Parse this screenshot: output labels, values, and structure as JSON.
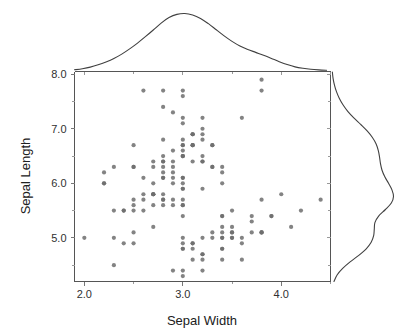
{
  "chart_data": {
    "type": "scatter",
    "title": "",
    "subtitle": "",
    "xlabel": "Sepal Width",
    "ylabel": "Sepal Length",
    "xlim": [
      1.9,
      4.5
    ],
    "ylim": [
      4.2,
      8.05
    ],
    "xticks": [
      2.0,
      3.0,
      4.0
    ],
    "xtick_labels": [
      "2.0",
      "3.0",
      "4.0"
    ],
    "yticks": [
      5.0,
      6.0,
      7.0,
      8.0
    ],
    "ytick_labels": [
      "5.0",
      "6.0",
      "7.0",
      "8.0"
    ],
    "x_minor_ticks": [
      2.5,
      3.5,
      4.5
    ],
    "y_minor_ticks": [
      4.5,
      5.5,
      6.5,
      7.5
    ],
    "grid": false,
    "legend": null,
    "marker_color": "#6d6d6d",
    "curve_color": "#404040",
    "axis_color": "#555555",
    "marginal": {
      "top": {
        "variable": "Sepal Width",
        "type": "kde",
        "peak_x": 3.02,
        "kde_x": [
          1.9,
          1.98,
          2.06,
          2.14,
          2.22,
          2.3,
          2.38,
          2.46,
          2.54,
          2.62,
          2.7,
          2.78,
          2.86,
          2.94,
          3.02,
          3.1,
          3.18,
          3.26,
          3.34,
          3.42,
          3.5,
          3.58,
          3.66,
          3.74,
          3.82,
          3.9,
          3.98,
          4.06,
          4.14,
          4.22,
          4.3,
          4.38,
          4.46
        ],
        "kde_y": [
          0.03,
          0.048,
          0.075,
          0.115,
          0.165,
          0.225,
          0.3,
          0.39,
          0.49,
          0.6,
          0.715,
          0.835,
          0.93,
          0.985,
          1.0,
          0.975,
          0.915,
          0.825,
          0.72,
          0.615,
          0.52,
          0.44,
          0.38,
          0.33,
          0.28,
          0.225,
          0.17,
          0.12,
          0.08,
          0.055,
          0.038,
          0.028,
          0.022
        ]
      },
      "right": {
        "variable": "Sepal Length",
        "type": "kde",
        "peak_y": 5.75,
        "kde_x": [
          4.2,
          4.32,
          4.44,
          4.56,
          4.68,
          4.8,
          4.92,
          5.04,
          5.16,
          5.28,
          5.4,
          5.52,
          5.64,
          5.76,
          5.88,
          6.0,
          6.12,
          6.24,
          6.36,
          6.48,
          6.6,
          6.72,
          6.84,
          6.96,
          7.08,
          7.2,
          7.32,
          7.44,
          7.56,
          7.68,
          7.8,
          7.92,
          8.04
        ],
        "kde_y": [
          0.04,
          0.09,
          0.18,
          0.3,
          0.44,
          0.56,
          0.64,
          0.68,
          0.69,
          0.7,
          0.76,
          0.87,
          0.965,
          1.0,
          0.975,
          0.92,
          0.86,
          0.815,
          0.79,
          0.775,
          0.755,
          0.72,
          0.66,
          0.575,
          0.47,
          0.36,
          0.262,
          0.185,
          0.125,
          0.08,
          0.048,
          0.026,
          0.014
        ]
      }
    },
    "points": [
      [
        3.5,
        5.1
      ],
      [
        3.0,
        4.9
      ],
      [
        3.2,
        4.7
      ],
      [
        3.1,
        4.6
      ],
      [
        3.6,
        5.0
      ],
      [
        3.9,
        5.4
      ],
      [
        3.4,
        4.6
      ],
      [
        3.4,
        5.0
      ],
      [
        2.9,
        4.4
      ],
      [
        3.1,
        4.9
      ],
      [
        3.7,
        5.4
      ],
      [
        3.4,
        4.8
      ],
      [
        3.0,
        4.8
      ],
      [
        3.0,
        4.3
      ],
      [
        4.0,
        5.8
      ],
      [
        4.4,
        5.7
      ],
      [
        3.9,
        5.4
      ],
      [
        3.5,
        5.1
      ],
      [
        3.8,
        5.7
      ],
      [
        3.8,
        5.1
      ],
      [
        3.4,
        5.4
      ],
      [
        3.7,
        5.1
      ],
      [
        3.6,
        4.6
      ],
      [
        3.3,
        5.1
      ],
      [
        3.4,
        4.8
      ],
      [
        3.0,
        5.0
      ],
      [
        3.4,
        5.0
      ],
      [
        3.5,
        5.2
      ],
      [
        3.4,
        5.2
      ],
      [
        3.2,
        4.7
      ],
      [
        3.1,
        4.8
      ],
      [
        3.4,
        5.4
      ],
      [
        4.1,
        5.2
      ],
      [
        4.2,
        5.5
      ],
      [
        3.1,
        4.9
      ],
      [
        3.2,
        5.0
      ],
      [
        3.5,
        5.5
      ],
      [
        3.6,
        4.9
      ],
      [
        3.0,
        4.4
      ],
      [
        3.4,
        5.1
      ],
      [
        3.5,
        5.0
      ],
      [
        2.3,
        4.5
      ],
      [
        3.2,
        4.4
      ],
      [
        3.5,
        5.0
      ],
      [
        3.8,
        5.1
      ],
      [
        3.0,
        4.8
      ],
      [
        3.8,
        5.1
      ],
      [
        3.2,
        4.6
      ],
      [
        3.7,
        5.3
      ],
      [
        3.3,
        5.0
      ],
      [
        3.2,
        7.0
      ],
      [
        3.2,
        6.4
      ],
      [
        3.1,
        6.9
      ],
      [
        2.3,
        5.5
      ],
      [
        2.8,
        6.5
      ],
      [
        2.8,
        5.7
      ],
      [
        3.3,
        6.3
      ],
      [
        2.4,
        4.9
      ],
      [
        2.9,
        6.6
      ],
      [
        2.7,
        5.2
      ],
      [
        2.0,
        5.0
      ],
      [
        3.0,
        5.9
      ],
      [
        2.2,
        6.0
      ],
      [
        2.9,
        6.1
      ],
      [
        2.9,
        5.6
      ],
      [
        3.1,
        6.7
      ],
      [
        3.0,
        5.6
      ],
      [
        2.7,
        5.8
      ],
      [
        2.2,
        6.2
      ],
      [
        2.5,
        5.6
      ],
      [
        3.2,
        5.9
      ],
      [
        2.8,
        6.1
      ],
      [
        2.5,
        6.3
      ],
      [
        2.8,
        6.1
      ],
      [
        2.9,
        6.4
      ],
      [
        3.0,
        6.6
      ],
      [
        2.8,
        6.8
      ],
      [
        3.0,
        6.7
      ],
      [
        2.9,
        6.0
      ],
      [
        2.6,
        5.7
      ],
      [
        2.4,
        5.5
      ],
      [
        2.4,
        5.5
      ],
      [
        2.7,
        5.8
      ],
      [
        2.7,
        6.0
      ],
      [
        3.0,
        5.4
      ],
      [
        3.4,
        6.0
      ],
      [
        3.1,
        6.7
      ],
      [
        2.3,
        6.3
      ],
      [
        3.0,
        5.6
      ],
      [
        2.5,
        5.5
      ],
      [
        2.6,
        5.5
      ],
      [
        3.0,
        6.1
      ],
      [
        2.6,
        5.8
      ],
      [
        2.3,
        5.0
      ],
      [
        2.7,
        5.6
      ],
      [
        3.0,
        5.7
      ],
      [
        2.9,
        5.7
      ],
      [
        2.9,
        6.2
      ],
      [
        2.5,
        5.1
      ],
      [
        2.8,
        5.7
      ],
      [
        3.3,
        6.3
      ],
      [
        2.7,
        5.8
      ],
      [
        3.0,
        7.1
      ],
      [
        2.9,
        6.3
      ],
      [
        3.0,
        6.5
      ],
      [
        3.0,
        7.6
      ],
      [
        2.5,
        4.9
      ],
      [
        2.9,
        7.3
      ],
      [
        2.5,
        6.7
      ],
      [
        3.6,
        7.2
      ],
      [
        3.2,
        6.5
      ],
      [
        2.7,
        6.4
      ],
      [
        3.0,
        6.8
      ],
      [
        2.5,
        5.7
      ],
      [
        2.8,
        5.8
      ],
      [
        3.2,
        6.4
      ],
      [
        3.0,
        6.5
      ],
      [
        3.8,
        7.7
      ],
      [
        2.6,
        7.7
      ],
      [
        2.2,
        6.0
      ],
      [
        3.2,
        6.9
      ],
      [
        2.8,
        5.6
      ],
      [
        2.8,
        7.7
      ],
      [
        2.7,
        6.3
      ],
      [
        3.3,
        6.7
      ],
      [
        3.2,
        7.2
      ],
      [
        2.8,
        6.2
      ],
      [
        3.0,
        6.1
      ],
      [
        2.8,
        6.4
      ],
      [
        3.0,
        7.2
      ],
      [
        2.8,
        7.4
      ],
      [
        3.8,
        7.9
      ],
      [
        2.8,
        6.4
      ],
      [
        2.8,
        6.3
      ],
      [
        2.6,
        6.1
      ],
      [
        3.0,
        7.7
      ],
      [
        3.4,
        6.3
      ],
      [
        3.1,
        6.4
      ],
      [
        3.0,
        6.0
      ],
      [
        3.1,
        6.9
      ],
      [
        3.1,
        6.7
      ],
      [
        3.1,
        6.9
      ],
      [
        2.7,
        5.8
      ],
      [
        3.2,
        6.8
      ],
      [
        3.3,
        6.7
      ],
      [
        3.0,
        6.7
      ],
      [
        2.5,
        6.3
      ],
      [
        3.0,
        6.5
      ],
      [
        3.4,
        6.2
      ],
      [
        3.0,
        5.9
      ]
    ]
  },
  "axes": {
    "x_title": "Sepal Width",
    "y_title": "Sepal Length"
  }
}
